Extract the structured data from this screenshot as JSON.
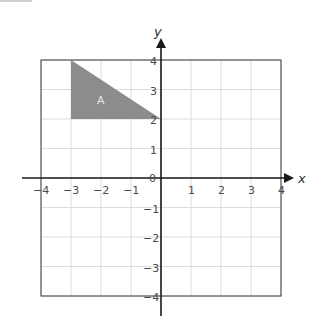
{
  "diagram": {
    "type": "coordinate-plane",
    "x_axis": {
      "label": "x",
      "min": -4,
      "max": 4,
      "ticks": [
        "−4",
        "−3",
        "−2",
        "−1",
        "1",
        "2",
        "3",
        "4"
      ]
    },
    "y_axis": {
      "label": "y",
      "min": -4,
      "max": 4,
      "ticks": [
        "4",
        "3",
        "2",
        "1",
        "−1",
        "−2",
        "−3",
        "−4"
      ]
    },
    "origin_label": "0",
    "shapes": [
      {
        "name": "A",
        "label": "A",
        "kind": "triangle",
        "vertices": [
          [
            -3,
            4
          ],
          [
            -3,
            2
          ],
          [
            0,
            2
          ]
        ],
        "fill": "#8c8c8c"
      }
    ],
    "colors": {
      "grid": "#dcdcdc",
      "frame": "#3a3a3a",
      "axis": "#1a1a1a",
      "shape_fill": "#8c8c8c",
      "shape_label": "#e8e8e8"
    }
  }
}
